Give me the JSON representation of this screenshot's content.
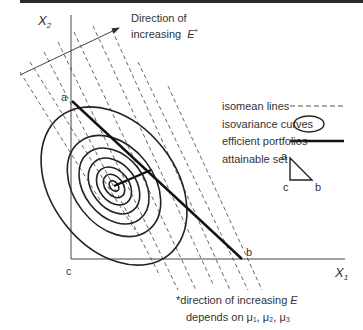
{
  "axes": {
    "y_label": "X",
    "y_sub": "2",
    "x_label": "X",
    "x_sub": "1",
    "origin_label": "c"
  },
  "direction_arrow": {
    "line1": "Direction of",
    "line2": "increasing",
    "symbol": "E",
    "symbol_sup": "*"
  },
  "points": {
    "a": "a",
    "b": "b"
  },
  "legend": {
    "isomean": "isomean lines",
    "isovariance": "isovariance curves",
    "efficient": "efficient portfolios",
    "attainable": "attainable set",
    "triangle_a": "a",
    "triangle_b": "b",
    "triangle_c": "c"
  },
  "footnote": {
    "line1_prefix": "*direction of increasing ",
    "line1_symbol": "E",
    "line2": "depends on  μ₁, μ₂, μ₃"
  },
  "colors": {
    "ink": "#222222",
    "text": "#333333",
    "dashed": "#555555",
    "background": "#ffffff"
  }
}
